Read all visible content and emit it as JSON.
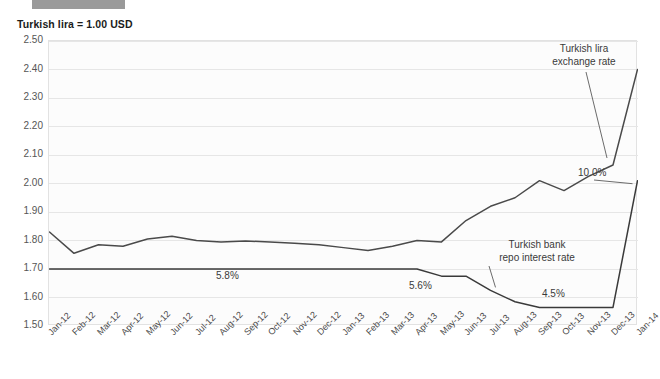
{
  "header": {
    "bar_color": "#9a9a9a",
    "title": "Turkish lira = 1.00 USD"
  },
  "chart_data": {
    "type": "line",
    "title": "Turkish lira = 1.00 USD",
    "xlabel": "",
    "ylabel": "",
    "ylim": [
      1.5,
      2.5
    ],
    "ytick_step": 0.1,
    "grid": true,
    "legend_position": "inline-annotations",
    "ytick_labels": [
      "2.50",
      "2.40",
      "2.30",
      "2.20",
      "2.10",
      "2.00",
      "1.90",
      "1.80",
      "1.70",
      "1.60",
      "1.50"
    ],
    "categories": [
      "Jan-12",
      "Feb-12",
      "Mar-12",
      "Apr-12",
      "May-12",
      "Jun-12",
      "Jul-12",
      "Aug-12",
      "Sep-12",
      "Oct-12",
      "Nov-12",
      "Dec-12",
      "Jan-13",
      "Feb-13",
      "Mar-13",
      "Apr-13",
      "May-13",
      "Jun-13",
      "Jul-13",
      "Aug-13",
      "Sep-13",
      "Oct-13",
      "Nov-13",
      "Dec-13",
      "Jan-14"
    ],
    "series": [
      {
        "name": "Turkish lira exchange rate",
        "unit": "TRY per 1.00 USD",
        "color": "#4a4a4a",
        "values": [
          1.83,
          1.755,
          1.785,
          1.78,
          1.805,
          1.815,
          1.8,
          1.795,
          1.798,
          1.795,
          1.79,
          1.785,
          1.775,
          1.765,
          1.78,
          1.8,
          1.795,
          1.87,
          1.92,
          1.95,
          2.01,
          1.975,
          2.025,
          2.065,
          2.4
        ]
      },
      {
        "name": "Turkish bank repo interest rate",
        "unit": "percent",
        "color": "#3a3a3a",
        "axis": "right-implied",
        "values": [
          5.8,
          5.8,
          5.8,
          5.8,
          5.8,
          5.8,
          5.8,
          5.8,
          5.8,
          5.8,
          5.8,
          5.8,
          5.8,
          5.8,
          5.8,
          5.8,
          5.6,
          5.6,
          5.2,
          4.8,
          4.5,
          4.5,
          4.5,
          4.5,
          10.0
        ],
        "plot_positions": [
          1.7,
          1.7,
          1.7,
          1.7,
          1.7,
          1.7,
          1.7,
          1.7,
          1.7,
          1.7,
          1.7,
          1.7,
          1.7,
          1.7,
          1.7,
          1.7,
          1.675,
          1.675,
          1.625,
          1.585,
          1.565,
          1.565,
          1.565,
          1.565,
          2.01
        ]
      }
    ],
    "annotations": [
      {
        "id": "exchange-rate-annotation",
        "text_line1": "Turkish lira",
        "text_line2": "exchange rate",
        "series": "Turkish lira exchange rate"
      },
      {
        "id": "repo-rate-annotation",
        "text_line1": "Turkish bank",
        "text_line2": "repo interest rate",
        "series": "Turkish bank repo interest rate"
      }
    ],
    "data_labels": [
      {
        "id": "repo-label-58",
        "text": "5.8%",
        "category": "Jul-12",
        "value": 5.8
      },
      {
        "id": "repo-label-56",
        "text": "5.6%",
        "category": "May-13",
        "value": 5.6
      },
      {
        "id": "repo-label-45",
        "text": "4.5%",
        "category": "Oct-13",
        "value": 4.5
      },
      {
        "id": "repo-label-100",
        "text": "10.0%",
        "category": "Jan-14",
        "value": 10.0
      }
    ]
  }
}
